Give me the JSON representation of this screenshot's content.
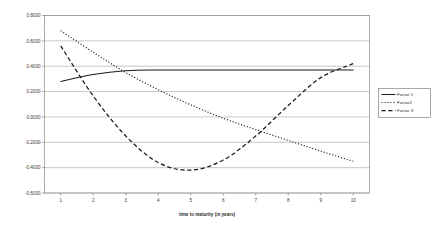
{
  "chart_data": {
    "type": "line",
    "title": "",
    "xlabel": "time to maturity (in years)",
    "ylabel": "",
    "x": [
      1,
      2,
      3,
      4,
      5,
      6,
      7,
      8,
      9,
      10
    ],
    "xlim": [
      0.5,
      10.5
    ],
    "ylim": [
      -0.6,
      0.8
    ],
    "ytick_labels": [
      "0.8000",
      "0.6000",
      "0.4000",
      "0.2000",
      "0.0000",
      "-0.2000",
      "-0.4000",
      "-0.6000"
    ],
    "ytick_values": [
      0.8,
      0.6,
      0.4,
      0.2,
      0.0,
      -0.2,
      -0.4,
      -0.6
    ],
    "xtick_labels": [
      "1",
      "2",
      "3",
      "4",
      "5",
      "6",
      "7",
      "8",
      "9",
      "10"
    ],
    "grid": true,
    "grid_axis": "y",
    "legend_position": "right-outside",
    "series": [
      {
        "name": "Factor 1",
        "style": "solid",
        "values": [
          0.28,
          0.335,
          0.365,
          0.37,
          0.37,
          0.37,
          0.37,
          0.37,
          0.37,
          0.37
        ]
      },
      {
        "name": "Factor2",
        "style": "dotted",
        "values": [
          0.68,
          0.51,
          0.35,
          0.215,
          0.095,
          -0.01,
          -0.1,
          -0.185,
          -0.27,
          -0.35
        ]
      },
      {
        "name": "Factor 3",
        "style": "dashed",
        "values": [
          0.56,
          0.165,
          -0.15,
          -0.36,
          -0.42,
          -0.34,
          -0.15,
          0.09,
          0.31,
          0.42
        ]
      }
    ]
  },
  "legend": {
    "entries": [
      {
        "label": "Factor 1",
        "style": "solid"
      },
      {
        "label": "Factor2",
        "style": "dotted"
      },
      {
        "label": "Factor 3",
        "style": "dashed"
      }
    ]
  },
  "colors": {
    "series": "#1a1a1a",
    "gridline": "#9a9a9a",
    "border": "#8d8d8d",
    "text": "#2b2b2b",
    "background": "#ffffff"
  }
}
